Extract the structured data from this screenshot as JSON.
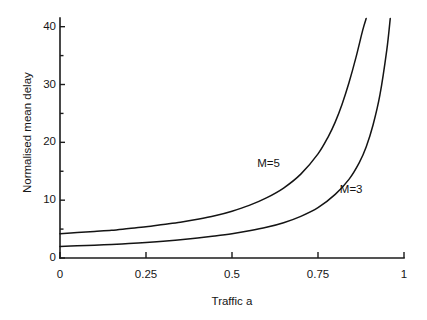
{
  "chart_data": {
    "type": "line",
    "title": "",
    "xlabel": "Traffic a",
    "ylabel": "Normalised mean delay",
    "xlim": [
      0,
      1
    ],
    "ylim": [
      0,
      41.5
    ],
    "grid": false,
    "legend_position": "inline-annotations",
    "xticks": [
      0,
      0.25,
      0.5,
      0.75,
      1
    ],
    "xtick_labels": [
      "0",
      "0.25",
      "0.5",
      "0.75",
      "1"
    ],
    "yticks": [
      0,
      10,
      20,
      30,
      40
    ],
    "ytick_labels": [
      "0",
      "10",
      "20",
      "30",
      "40"
    ],
    "yminor_ticks": [
      5,
      15,
      25,
      35
    ],
    "series": [
      {
        "name": "M=5",
        "label": "M=5",
        "annotation": "M=5",
        "x": [
          0.0,
          0.05,
          0.1,
          0.15,
          0.2,
          0.25,
          0.3,
          0.35,
          0.4,
          0.45,
          0.5,
          0.55,
          0.6,
          0.65,
          0.7,
          0.75,
          0.78,
          0.8,
          0.82,
          0.84,
          0.86,
          0.88,
          0.89
        ],
        "values": [
          4.2,
          4.4,
          4.6,
          4.8,
          5.1,
          5.4,
          5.8,
          6.2,
          6.7,
          7.3,
          8.1,
          9.1,
          10.4,
          12.1,
          14.5,
          18.0,
          21.0,
          23.5,
          26.6,
          30.3,
          34.6,
          39.4,
          41.4
        ]
      },
      {
        "name": "M=3",
        "label": "M=3",
        "annotation": "M=3",
        "x": [
          0.0,
          0.05,
          0.1,
          0.15,
          0.2,
          0.25,
          0.3,
          0.35,
          0.4,
          0.45,
          0.5,
          0.55,
          0.6,
          0.65,
          0.7,
          0.75,
          0.8,
          0.84,
          0.87,
          0.89,
          0.91,
          0.93,
          0.95,
          0.96
        ],
        "values": [
          2.0,
          2.1,
          2.2,
          2.35,
          2.5,
          2.7,
          2.9,
          3.15,
          3.45,
          3.8,
          4.2,
          4.7,
          5.3,
          6.1,
          7.2,
          8.7,
          11.0,
          13.6,
          16.5,
          19.2,
          23.0,
          28.2,
          36.0,
          41.4
        ]
      }
    ],
    "annotations": [
      {
        "text": "M=5",
        "x": 0.62,
        "y": 16.0
      },
      {
        "text": "M=3",
        "x": 0.86,
        "y": 11.5
      }
    ],
    "colors": {
      "line": "#141414",
      "axis": "#1b1b1b",
      "background": "#ffffff",
      "text": "#161616"
    }
  },
  "geometry": {
    "plot_left": 60,
    "plot_right": 404,
    "plot_bottom": 258,
    "plot_top": 18
  }
}
